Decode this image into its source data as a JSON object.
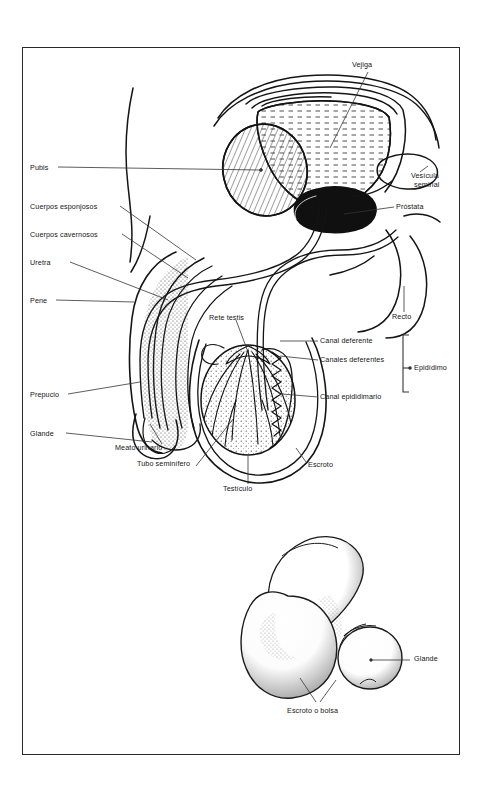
{
  "figure": {
    "title_visible": false,
    "background": "#ffffff",
    "frame_color": "#2a2a2a",
    "ink_color": "#151515"
  },
  "panels": [
    {
      "id": "sagittal-section",
      "description": "Corte sagital del aparato reproductor masculino"
    },
    {
      "id": "external-view",
      "description": "Vista externa de los genitales masculinos"
    }
  ],
  "labels_left": [
    {
      "name": "pubis",
      "text": "Pubis",
      "x": 30,
      "y": 164
    },
    {
      "name": "cuerpos-esponjosos",
      "text": "Cuerpos esponjosos",
      "x": 30,
      "y": 203
    },
    {
      "name": "cuerpos-cavernosos",
      "text": "Cuerpos cavernosos",
      "x": 30,
      "y": 231
    },
    {
      "name": "uretra",
      "text": "Uretra",
      "x": 30,
      "y": 259
    },
    {
      "name": "pene",
      "text": "Pene",
      "x": 30,
      "y": 297
    },
    {
      "name": "prepucio",
      "text": "Prepucio",
      "x": 30,
      "y": 391
    },
    {
      "name": "glande",
      "text": "Glande",
      "x": 30,
      "y": 430
    }
  ],
  "labels_center": [
    {
      "name": "rete-testis",
      "text": "Rete testis",
      "x": 209,
      "y": 314
    },
    {
      "name": "meato-urinario",
      "text": "Meato urinario",
      "x": 115,
      "y": 447
    },
    {
      "name": "tubo-seminifero",
      "text": "Tubo seminífero",
      "x": 137,
      "y": 462
    },
    {
      "name": "testiculo",
      "text": "Testículo",
      "x": 223,
      "y": 487
    }
  ],
  "labels_right": [
    {
      "name": "vejiga",
      "text": "Vejiga",
      "x": 352,
      "y": 64
    },
    {
      "name": "vesicula-seminal-l1",
      "text": "Vesícula",
      "x": 414,
      "y": 176
    },
    {
      "name": "vesicula-seminal-l2",
      "text": "seminal",
      "x": 414,
      "y": 185
    },
    {
      "name": "prostata",
      "text": "Próstata",
      "x": 396,
      "y": 205
    },
    {
      "name": "recto",
      "text": "Recto",
      "x": 392,
      "y": 315
    },
    {
      "name": "canal-deferente",
      "text": "Canal deferente",
      "x": 320,
      "y": 340
    },
    {
      "name": "canales-deferentes",
      "text": "Canales deferentes",
      "x": 320,
      "y": 359
    },
    {
      "name": "canal-epididimario",
      "text": "Canal epididimario",
      "x": 320,
      "y": 396
    },
    {
      "name": "escroto",
      "text": "Escroto",
      "x": 308,
      "y": 464
    },
    {
      "name": "epididimo",
      "text": "Epidídimo",
      "x": 414,
      "y": 368
    }
  ],
  "labels_bottom": [
    {
      "name": "glande-externo",
      "text": "Glande",
      "x": 414,
      "y": 657
    },
    {
      "name": "escroto-o-bolsa",
      "text": "Escroto o bolsa",
      "x": 287,
      "y": 710
    }
  ],
  "bracket": {
    "name": "epididimo-bracket",
    "x": 404,
    "y_top": 335,
    "y_bottom": 392
  }
}
